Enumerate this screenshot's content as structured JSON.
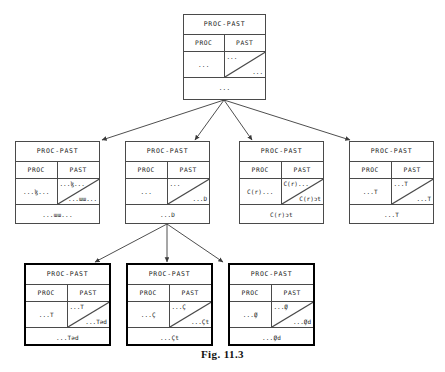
{
  "figure": {
    "caption": "Fig. 11.3",
    "header_label": "PROC-PAST",
    "col_left_label": "PROC",
    "col_right_label": "PAST"
  },
  "colors": {
    "background": "#ffffff",
    "rule": "#4a4a4a",
    "bold_rule": "#000000",
    "text": "#1a1a1a",
    "arrow": "#3a3a3a"
  },
  "nodes": {
    "root": {
      "header": "PROC-PAST",
      "col_left": "PROC",
      "col_right": "PAST",
      "left_cell": "...",
      "right_top": "...",
      "right_bottom": "...",
      "bottom": "..."
    },
    "level2": [
      {
        "header": "PROC-PAST",
        "col_left": "PROC",
        "col_right": "PAST",
        "left_cell": "...ɮ...",
        "right_top": "...ɮ...",
        "right_bottom": "...ɯɯ...",
        "bottom": "...ɯɯ..."
      },
      {
        "header": "PROC-PAST",
        "col_left": "PROC",
        "col_right": "PAST",
        "left_cell": "...",
        "right_top": "...",
        "right_bottom": "...D",
        "bottom": "...D"
      },
      {
        "header": "PROC-PAST",
        "col_left": "PROC",
        "col_right": "PAST",
        "left_cell": "C(r)...",
        "right_top": "C(r)...",
        "right_bottom": "C(r)ɔt",
        "bottom": "C(r)ɔt"
      },
      {
        "header": "PROC-PAST",
        "col_left": "PROC",
        "col_right": "PAST",
        "left_cell": "...T",
        "right_top": "...T",
        "right_bottom": "...T",
        "bottom": "...T"
      }
    ],
    "level3": [
      {
        "header": "PROC-PAST",
        "col_left": "PROC",
        "col_right": "PAST",
        "left_cell": "...T",
        "right_top": "...T",
        "right_bottom": "...Təd",
        "bottom": "...Təd"
      },
      {
        "header": "PROC-PAST",
        "col_left": "PROC",
        "col_right": "PAST",
        "left_cell": "...Ç",
        "right_top": "...Ç",
        "right_bottom": "...Çt",
        "bottom": "...Çt"
      },
      {
        "header": "PROC-PAST",
        "col_left": "PROC",
        "col_right": "PAST",
        "left_cell": "...Ø̧",
        "right_top": "...Ø̧",
        "right_bottom": "...Ø̧d",
        "bottom": "...Ø̧d"
      }
    ]
  }
}
